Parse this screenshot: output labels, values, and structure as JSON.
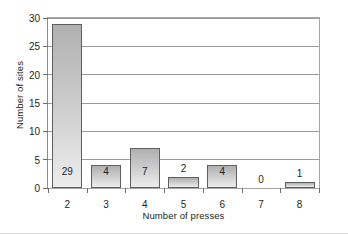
{
  "chart_data": {
    "type": "bar",
    "title": "",
    "subtitle": "",
    "xlabel": "Number of presses",
    "ylabel": "Number of sites",
    "categories": [
      "2",
      "3",
      "4",
      "5",
      "6",
      "7",
      "8"
    ],
    "values": [
      29,
      4,
      7,
      2,
      4,
      0,
      1
    ],
    "value_labels": [
      "29",
      "4",
      "7",
      "2",
      "4",
      "0",
      "1"
    ],
    "label_placement": [
      "inside",
      "inside",
      "inside",
      "above",
      "inside",
      "above",
      "above"
    ],
    "ylim": [
      0,
      30
    ],
    "ytick_values": [
      0,
      5,
      10,
      15,
      20,
      25,
      30
    ],
    "ytick_labels": [
      "0",
      "5",
      "10",
      "15",
      "20",
      "25",
      "30"
    ],
    "grid": true,
    "grid_axis": "y",
    "legend": false,
    "legend_position": "none",
    "bar_fill_top": "#b0b0b0",
    "bar_fill_bottom": "#ececec",
    "bar_border": "#5f5f5f",
    "gridline_color": "#9b9b9b",
    "axis_color": "#8c8c8c",
    "text_color": "#231f20"
  }
}
